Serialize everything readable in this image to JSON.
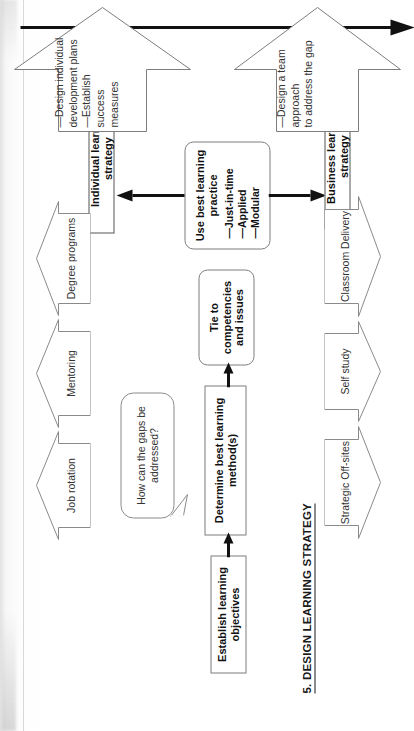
{
  "document": {
    "type": "process-flow-diagram",
    "orientation": "page rotated 90 degrees counter-clockwise",
    "section_title": "5. DESIGN LEARNING STRATEGY"
  },
  "process_flow": {
    "steps": [
      {
        "id": "objectives",
        "label": "Establish learning objectives",
        "style": "rectangle"
      },
      {
        "id": "methods",
        "label": "Determine best learning method(s)",
        "style": "rectangle"
      },
      {
        "id": "tie",
        "label": "Tie to competencies and issues",
        "style": "rounded"
      },
      {
        "id": "practice",
        "label": "Use best learning practice",
        "style": "rounded"
      }
    ],
    "practice_bullets": [
      "—Just-in-time",
      "—Applied",
      "—Modular"
    ]
  },
  "callout": {
    "text": "How can the gaps be addressed?"
  },
  "individual": {
    "methods": [
      "Job rotation",
      "Mentoring",
      "Degree programs"
    ],
    "strategy_label": "Individual learning strategy",
    "outcomes": "—Design individual\ndevelopment plans\n—Establish success\nmeasures"
  },
  "business": {
    "methods": [
      "Strategic Off-sites",
      "Self study",
      "Classroom Delivery"
    ],
    "strategy_label": "Business learning strategy",
    "outcomes": "—Design a team approach\nto address the gap"
  },
  "colors": {
    "ink": "#111111",
    "line": "#7d7d7d",
    "paper": "#ffffff",
    "muted_text": "#333333"
  }
}
